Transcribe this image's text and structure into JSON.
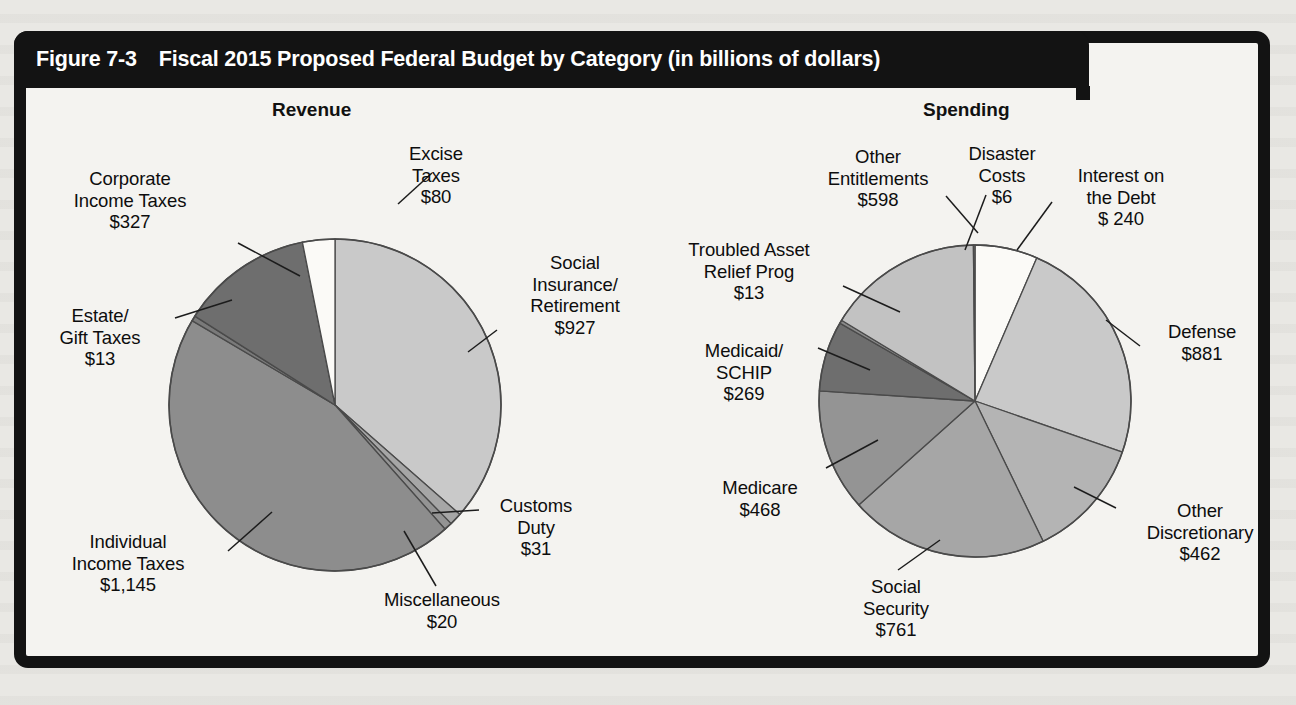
{
  "figure": {
    "number": "Figure 7-3",
    "title": "Fiscal 2015 Proposed Federal Budget by Category (in billions of dollars)"
  },
  "panels": {
    "revenue_heading": "Revenue",
    "spending_heading": "Spending"
  },
  "labels": {
    "rev_corporate": "Corporate\nIncome Taxes\n$327",
    "rev_estate": "Estate/\nGift Taxes\n$13",
    "rev_individual": "Individual\nIncome Taxes\n$1,145",
    "rev_misc": "Miscellaneous\n$20",
    "rev_customs": "Customs\nDuty\n$31",
    "rev_social": "Social\nInsurance/\nRetirement\n$927",
    "rev_excise": "Excise\nTaxes\n$80",
    "sp_other_ent": "Other\nEntitlements\n$598",
    "sp_disaster": "Disaster\nCosts\n$6",
    "sp_interest": "Interest on\nthe Debt\n$ 240",
    "sp_defense": "Defense\n$881",
    "sp_other_disc": "Other\nDiscretionary\n$462",
    "sp_social_security": "Social\nSecurity\n$761",
    "sp_medicare": "Medicare\n$468",
    "sp_medicaid": "Medicaid/\nSCHIP\n$269",
    "sp_tarp": "Troubled Asset\nRelief Prog\n$13"
  },
  "colors": {
    "frame": "#131313",
    "title_bar": "#131313",
    "title_text": "#ffffff",
    "page_bg": "#e9e8e4",
    "panel_bg": "#f4f3f0",
    "slice_stroke": "#4a4a4a",
    "white": "#fbfaf7",
    "light_gray": "#c9c9c9",
    "light_gray_2": "#c2c2c2",
    "mid_light_gray": "#b4b4b4",
    "mid_gray": "#a6a6a6",
    "mid_dark_gray": "#949494",
    "dark_gray": "#7a7a7a",
    "darker_gray": "#6e6e6e"
  },
  "chart_data": [
    {
      "type": "pie",
      "title": "Revenue",
      "units": "billions of dollars",
      "total": 2543,
      "start_angle_deg": 0,
      "direction": "clockwise",
      "center": [
        335,
        405
      ],
      "radius": 166,
      "slices": [
        {
          "label": "Social Insurance/Retirement",
          "value": 927,
          "color": "#c9c9c9"
        },
        {
          "label": "Customs Duty",
          "value": 31,
          "color": "#a6a6a6"
        },
        {
          "label": "Miscellaneous",
          "value": 20,
          "color": "#949494"
        },
        {
          "label": "Individual Income Taxes",
          "value": 1145,
          "color": "#8d8d8d"
        },
        {
          "label": "Estate/Gift Taxes",
          "value": 13,
          "color": "#7a7a7a"
        },
        {
          "label": "Corporate Income Taxes",
          "value": 327,
          "color": "#6e6e6e"
        },
        {
          "label": "Excise Taxes",
          "value": 80,
          "color": "#fbfaf7"
        }
      ]
    },
    {
      "type": "pie",
      "title": "Spending",
      "units": "billions of dollars",
      "total": 3698,
      "start_angle_deg": 0,
      "direction": "clockwise",
      "center": [
        975,
        401
      ],
      "radius": 156,
      "slices": [
        {
          "label": "Interest on the Debt",
          "value": 240,
          "color": "#fbfaf7"
        },
        {
          "label": "Defense",
          "value": 881,
          "color": "#c9c9c9"
        },
        {
          "label": "Other Discretionary",
          "value": 462,
          "color": "#b4b4b4"
        },
        {
          "label": "Social Security",
          "value": 761,
          "color": "#a6a6a6"
        },
        {
          "label": "Medicare",
          "value": 468,
          "color": "#949494"
        },
        {
          "label": "Medicaid/SCHIP",
          "value": 269,
          "color": "#6e6e6e"
        },
        {
          "label": "Troubled Asset Relief Prog",
          "value": 13,
          "color": "#8a8a8a"
        },
        {
          "label": "Other Entitlements",
          "value": 598,
          "color": "#c2c2c2"
        },
        {
          "label": "Disaster Costs",
          "value": 6,
          "color": "#7a7a7a"
        }
      ]
    }
  ]
}
